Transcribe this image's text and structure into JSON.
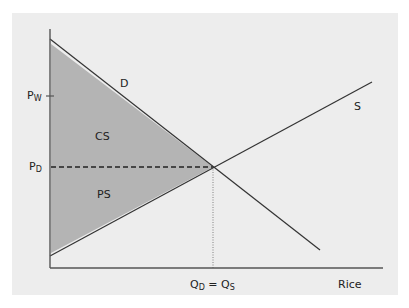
{
  "diagram": {
    "type": "supply-demand",
    "x_axis_label": "Rice",
    "y_axis_labels": {
      "world_price": {
        "main": "P",
        "sub": "W"
      },
      "domestic_price": {
        "main": "P",
        "sub": "D"
      }
    },
    "curves": {
      "demand": "D",
      "supply": "S"
    },
    "areas": {
      "consumer_surplus": "CS",
      "producer_surplus": "PS"
    },
    "equilibrium_quantity": {
      "left_main": "Q",
      "left_sub": "D",
      "equals": " = ",
      "right_main": "Q",
      "right_sub": "S"
    },
    "colors": {
      "panel_background": "#ededed",
      "shaded_area": "#b4b4b4",
      "lines": "#333333",
      "axes": "#555555"
    }
  }
}
